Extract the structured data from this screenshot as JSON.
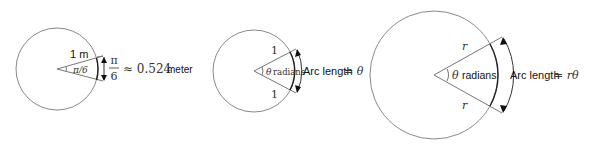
{
  "diagrams": [
    {
      "name": "one-meter-circle",
      "radius_label": "1 m",
      "angle_label": "π/6",
      "fraction_num": "π",
      "fraction_den": "6",
      "approx_label": "≈ 0.524",
      "unit_label": "meter"
    },
    {
      "name": "unit-circle",
      "top_radius_label": "1",
      "bottom_radius_label": "1",
      "angle_symbol": "θ",
      "angle_word": "radians",
      "arc_text": "Arc length",
      "arc_eq": "= θ"
    },
    {
      "name": "general-circle",
      "top_radius_label": "r",
      "bottom_radius_label": "r",
      "angle_symbol": "θ",
      "angle_word": "radians",
      "arc_text": "Arc length",
      "arc_eq": "= rθ"
    }
  ],
  "colors": {
    "circle_stroke": "#8a8a8a",
    "arc_stroke": "#222222",
    "text": "#111111"
  }
}
